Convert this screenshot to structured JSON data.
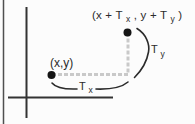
{
  "figure": {
    "colors": {
      "background": "#fcfcfc",
      "ink": "#2b2b2b",
      "axis": "#333333",
      "dot": "#151515",
      "translation_path": "#c9c9c9",
      "frame_border": "#4f4f4f"
    },
    "labels": {
      "origin_point": "(x,y)",
      "translated_point": {
        "part1": "(x + T",
        "sub1": "x",
        "part2": " , y + T",
        "sub2": "y",
        "part3": " )"
      },
      "tx": {
        "base": "T",
        "sub": "x"
      },
      "ty": {
        "base": "T",
        "sub": "y"
      }
    }
  }
}
